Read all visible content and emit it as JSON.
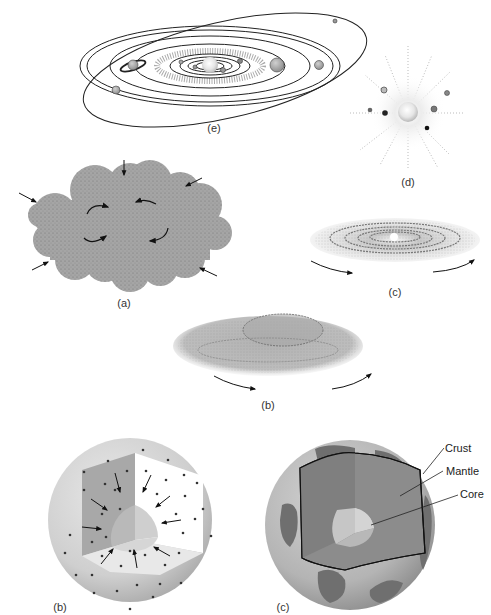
{
  "figure": {
    "panels": [
      {
        "id": "e",
        "label": "(e)",
        "description": "Solar system with planets on elliptical orbits"
      },
      {
        "id": "d",
        "label": "(d)",
        "description": "Young star with surrounding protoplanets"
      },
      {
        "id": "a",
        "label": "(a)",
        "description": "Collapsing rotating gas cloud (nebula)"
      },
      {
        "id": "c",
        "label": "(c)",
        "description": "Flattened rotating disk with rings"
      },
      {
        "id": "b",
        "label": "(b)",
        "description": "Rotating flattening nebula"
      },
      {
        "id": "b2",
        "label": "(b)",
        "description": "Cutaway sphere with particles moving inward"
      },
      {
        "id": "c2",
        "label": "(c)",
        "description": "Cutaway Earth showing layers"
      }
    ],
    "earth_layers": {
      "crust": "Crust",
      "mantle": "Mantle",
      "core": "Core"
    }
  },
  "colors": {
    "cloud": "#9a9a9a",
    "disk": "#b5b5b5",
    "sphere": "#c8c8c8",
    "mantle": "#8a8a8a",
    "core": "#c4c4c4",
    "continent": "#6f6f6f",
    "line": "#222222"
  }
}
